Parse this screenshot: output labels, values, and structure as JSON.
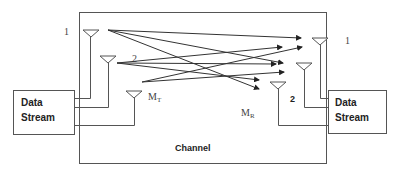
{
  "diagram": {
    "type": "MIMO channel block diagram",
    "channel_label": "Channel",
    "transmitter": {
      "block_label_line1": "Data",
      "block_label_line2": "Stream",
      "antenna_labels": [
        "1",
        "2",
        "M",
        "T"
      ],
      "antenna_count_label": "MT"
    },
    "receiver": {
      "block_label_line1": "Data",
      "block_label_line2": "Stream",
      "antenna_labels": [
        "1",
        "2",
        "M",
        "R"
      ],
      "antenna_count_label": "MR"
    },
    "paths": [
      {
        "from": "T1",
        "to": "R1"
      },
      {
        "from": "T1",
        "to": "R2"
      },
      {
        "from": "T1",
        "to": "RM"
      },
      {
        "from": "T2",
        "to": "R1"
      },
      {
        "from": "T2",
        "to": "R2"
      },
      {
        "from": "T2",
        "to": "RM"
      },
      {
        "from": "TM",
        "to": "R1"
      },
      {
        "from": "TM",
        "to": "R2"
      }
    ],
    "colors": {
      "lines": "#555555",
      "rays": "#333333",
      "background": "#ffffff"
    }
  }
}
